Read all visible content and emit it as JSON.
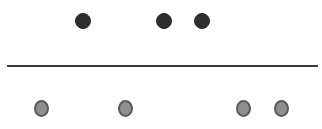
{
  "diagram": {
    "width": 322,
    "height": 129,
    "background": "#ffffff",
    "divider": {
      "x1": 7,
      "x2": 318,
      "y": 66,
      "thickness": 2,
      "color": "#3a3a3a"
    },
    "top_row": {
      "style": "dark",
      "fill": "#2f2f2f",
      "diameter": 16,
      "cy": 21,
      "dots": [
        {
          "cx": 83
        },
        {
          "cx": 164
        },
        {
          "cx": 202
        }
      ]
    },
    "bottom_row": {
      "style": "light",
      "fill": "#8f8f8f",
      "outline": "#5a5a5a",
      "width": 15,
      "height": 17,
      "cy": 108,
      "dots": [
        {
          "cx": 41
        },
        {
          "cx": 125
        },
        {
          "cx": 243
        },
        {
          "cx": 281
        }
      ]
    }
  }
}
